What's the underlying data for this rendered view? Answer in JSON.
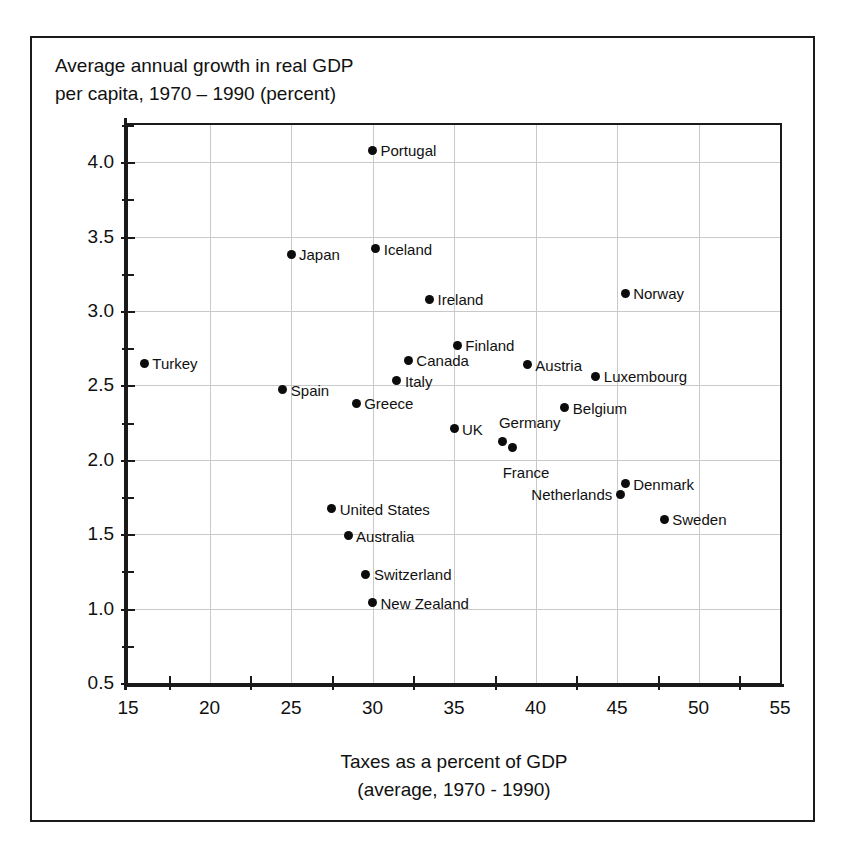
{
  "chart_data": {
    "type": "scatter",
    "title": "Average annual growth in real GDP\nper capita, 1970 – 1990 (percent)",
    "xlabel": "Taxes as a percent of GDP\n(average, 1970 - 1990)",
    "ylabel": "Average annual growth in real GDP per capita, 1970 – 1990 (percent)",
    "xlim": [
      15,
      55
    ],
    "ylim": [
      0.5,
      4.25
    ],
    "xticks": [
      15,
      20,
      25,
      30,
      35,
      40,
      45,
      50,
      55
    ],
    "xtick_labels": [
      "15",
      "20",
      "25",
      "30",
      "35",
      "40",
      "45",
      "50",
      "55"
    ],
    "xminor_ticks": [
      17.5,
      22.5,
      27.5,
      32.5,
      37.5,
      42.5,
      47.5,
      52.5
    ],
    "yticks": [
      0.5,
      1.0,
      1.5,
      2.0,
      2.5,
      3.0,
      3.5,
      4.0
    ],
    "ytick_labels": [
      "0.5",
      "1.0",
      "1.5",
      "2.0",
      "2.5",
      "3.0",
      "3.5",
      "4.0"
    ],
    "yminor_ticks": [
      0.75,
      1.25,
      1.75,
      2.25,
      2.75,
      3.25,
      3.75,
      4.25
    ],
    "grid": true,
    "grid_color": "#c9c9c9",
    "marker_color": "#0c0c0c",
    "legend": "none",
    "points": [
      {
        "label": "Portugal",
        "x": 30.0,
        "y": 4.08,
        "label_pos": "right"
      },
      {
        "label": "Iceland",
        "x": 30.2,
        "y": 3.42,
        "label_pos": "right"
      },
      {
        "label": "Japan",
        "x": 25.0,
        "y": 3.38,
        "label_pos": "right"
      },
      {
        "label": "Norway",
        "x": 45.5,
        "y": 3.12,
        "label_pos": "right"
      },
      {
        "label": "Ireland",
        "x": 33.5,
        "y": 3.08,
        "label_pos": "right"
      },
      {
        "label": "Finland",
        "x": 35.2,
        "y": 2.77,
        "label_pos": "right"
      },
      {
        "label": "Canada",
        "x": 32.2,
        "y": 2.67,
        "label_pos": "right"
      },
      {
        "label": "Turkey",
        "x": 16.0,
        "y": 2.65,
        "label_pos": "right"
      },
      {
        "label": "Austria",
        "x": 39.5,
        "y": 2.64,
        "label_pos": "right"
      },
      {
        "label": "Luxembourg",
        "x": 43.7,
        "y": 2.56,
        "label_pos": "right"
      },
      {
        "label": "Italy",
        "x": 31.5,
        "y": 2.53,
        "label_pos": "right"
      },
      {
        "label": "Spain",
        "x": 24.5,
        "y": 2.47,
        "label_pos": "right"
      },
      {
        "label": "Greece",
        "x": 29.0,
        "y": 2.38,
        "label_pos": "right"
      },
      {
        "label": "Belgium",
        "x": 41.8,
        "y": 2.35,
        "label_pos": "right"
      },
      {
        "label": "UK",
        "x": 35.0,
        "y": 2.21,
        "label_pos": "right"
      },
      {
        "label": "Germany",
        "x": 38.0,
        "y": 2.12,
        "label_pos": "germany"
      },
      {
        "label": "France",
        "x": 38.6,
        "y": 2.08,
        "label_pos": "france"
      },
      {
        "label": "Denmark",
        "x": 45.5,
        "y": 1.84,
        "label_pos": "right"
      },
      {
        "label": "Netherlands",
        "x": 45.2,
        "y": 1.77,
        "label_pos": "left"
      },
      {
        "label": "United States",
        "x": 27.5,
        "y": 1.67,
        "label_pos": "right"
      },
      {
        "label": "Sweden",
        "x": 47.9,
        "y": 1.6,
        "label_pos": "right"
      },
      {
        "label": "Australia",
        "x": 28.5,
        "y": 1.49,
        "label_pos": "right"
      },
      {
        "label": "Switzerland",
        "x": 29.6,
        "y": 1.23,
        "label_pos": "right"
      },
      {
        "label": "New Zealand",
        "x": 30.0,
        "y": 1.04,
        "label_pos": "right"
      }
    ]
  }
}
